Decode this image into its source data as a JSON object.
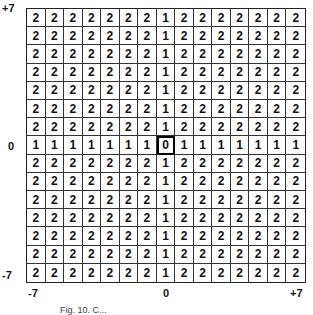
{
  "axis": {
    "y_top": "+7",
    "y_mid": "0",
    "y_bottom": "-7",
    "x_left": "-7",
    "x_mid": "0",
    "x_right": "+7"
  },
  "caption": "Fig. 10. C...",
  "grid": {
    "rows": 15,
    "cols": 15,
    "center_row": 7,
    "center_col": 7,
    "values": [
      [
        2,
        2,
        2,
        2,
        2,
        2,
        2,
        1,
        2,
        2,
        2,
        2,
        2,
        2,
        2
      ],
      [
        2,
        2,
        2,
        2,
        2,
        2,
        2,
        1,
        2,
        2,
        2,
        2,
        2,
        2,
        2
      ],
      [
        2,
        2,
        2,
        2,
        2,
        2,
        2,
        1,
        2,
        2,
        2,
        2,
        2,
        2,
        2
      ],
      [
        2,
        2,
        2,
        2,
        2,
        2,
        2,
        1,
        2,
        2,
        2,
        2,
        2,
        2,
        2
      ],
      [
        2,
        2,
        2,
        2,
        2,
        2,
        2,
        1,
        2,
        2,
        2,
        2,
        2,
        2,
        2
      ],
      [
        2,
        2,
        2,
        2,
        2,
        2,
        2,
        1,
        2,
        2,
        2,
        2,
        2,
        2,
        2
      ],
      [
        2,
        2,
        2,
        2,
        2,
        2,
        2,
        1,
        2,
        2,
        2,
        2,
        2,
        2,
        2
      ],
      [
        1,
        1,
        1,
        1,
        1,
        1,
        1,
        0,
        1,
        1,
        1,
        1,
        1,
        1,
        1
      ],
      [
        2,
        2,
        2,
        2,
        2,
        2,
        2,
        1,
        2,
        2,
        2,
        2,
        2,
        2,
        2
      ],
      [
        2,
        2,
        2,
        2,
        2,
        2,
        2,
        1,
        2,
        2,
        2,
        2,
        2,
        2,
        2
      ],
      [
        2,
        2,
        2,
        2,
        2,
        2,
        2,
        1,
        2,
        2,
        2,
        2,
        2,
        2,
        2
      ],
      [
        2,
        2,
        2,
        2,
        2,
        2,
        2,
        1,
        2,
        2,
        2,
        2,
        2,
        2,
        2
      ],
      [
        2,
        2,
        2,
        2,
        2,
        2,
        2,
        1,
        2,
        2,
        2,
        2,
        2,
        2,
        2
      ],
      [
        2,
        2,
        2,
        2,
        2,
        2,
        2,
        1,
        2,
        2,
        2,
        2,
        2,
        2,
        2
      ],
      [
        2,
        2,
        2,
        2,
        2,
        2,
        2,
        1,
        2,
        2,
        2,
        2,
        2,
        2,
        2
      ]
    ]
  }
}
